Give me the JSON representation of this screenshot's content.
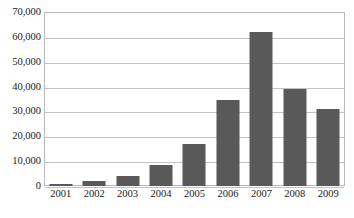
{
  "chart_data": {
    "type": "bar",
    "title": "",
    "subtitle": "",
    "xlabel": "",
    "ylabel": "",
    "categories": [
      "2001",
      "2002",
      "2003",
      "2004",
      "2005",
      "2006",
      "2007",
      "2008",
      "2009"
    ],
    "values": [
      700,
      2000,
      4000,
      8500,
      17000,
      34500,
      62000,
      39000,
      31000
    ],
    "series": [
      {
        "name": "",
        "values": [
          700,
          2000,
          4000,
          8500,
          17000,
          34500,
          62000,
          39000,
          31000
        ]
      }
    ],
    "ylim": [
      0,
      70000
    ],
    "y_ticks": [
      0,
      10000,
      20000,
      30000,
      40000,
      50000,
      60000,
      70000
    ],
    "y_tick_labels": [
      "0",
      "10,000",
      "20,000",
      "30,000",
      "40,000",
      "50,000",
      "60,000",
      "70,000"
    ],
    "x_tick_labels": [
      "2001",
      "2002",
      "2003",
      "2004",
      "2005",
      "2006",
      "2007",
      "2008",
      "2009"
    ],
    "grid": {
      "horizontal": true,
      "vertical": false
    },
    "legend": {
      "visible": false,
      "position": "none",
      "entries": []
    },
    "annotations": [],
    "colors": {
      "bar": "#595959",
      "gridline": "#c2c2c2",
      "plot_border": "#b9b9b9",
      "background": "#ffffff",
      "text": "#1a1a1a"
    }
  }
}
